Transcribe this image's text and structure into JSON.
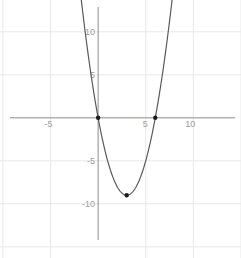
{
  "page": {
    "background": "#ffffff"
  },
  "chart_data": {
    "type": "line",
    "title": "",
    "xlabel": "",
    "ylabel": "",
    "legend": false,
    "grid": true,
    "grid_step": 5,
    "xlim": [
      -10.3,
      15.0
    ],
    "ylim": [
      -16.3,
      13.7
    ],
    "x_ticks": [
      {
        "value": -5,
        "label": "-5"
      },
      {
        "value": 5,
        "label": "5"
      },
      {
        "value": 10,
        "label": "10"
      }
    ],
    "y_ticks": [
      {
        "value": 10,
        "label": "10"
      },
      {
        "value": 5,
        "label": "5"
      },
      {
        "value": -5,
        "label": "-5"
      },
      {
        "value": -10,
        "label": "-10"
      }
    ],
    "series": [
      {
        "name": "y = x^2 - 6x",
        "quadratic": {
          "a": 1,
          "b": -6,
          "c": 0
        },
        "x_sample_range": [
          -2.8,
          8.8
        ],
        "sample_step": 0.05
      }
    ],
    "key_points": {
      "x_intercepts": [
        [
          0,
          0
        ],
        [
          6,
          0
        ]
      ],
      "vertex": [
        3,
        -9
      ]
    },
    "marked_points": [
      {
        "x": 0,
        "y": 0
      },
      {
        "x": 6,
        "y": 0
      },
      {
        "x": 3,
        "y": -9
      }
    ]
  },
  "colors": {
    "background": "#ffffff",
    "grid": "#e8e8e8",
    "axis": "#8c8c8c",
    "curve": "#5a5a5a",
    "point": "#1c1c1c",
    "tick_label": "#9b9b9b"
  }
}
